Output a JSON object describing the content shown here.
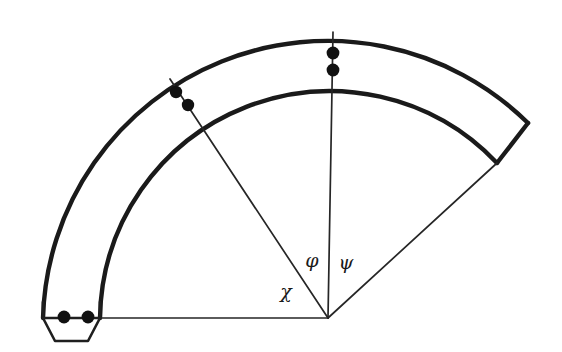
{
  "figure": {
    "background_color": "#ffffff",
    "stroke_color": "#1a1a1a",
    "dot_color": "#111111",
    "center": {
      "x": 328,
      "y": 318
    },
    "radii": {
      "outer": 285,
      "inner": 230
    },
    "angles_deg": {
      "start": 0,
      "end": 180
    },
    "labels": [
      {
        "id": "phi",
        "text": "φ",
        "x": 312,
        "y": 262
      },
      {
        "id": "psi",
        "text": "ψ",
        "x": 346,
        "y": 264
      },
      {
        "id": "chi",
        "text": "χ",
        "x": 286,
        "y": 293
      }
    ],
    "rays": [
      {
        "id": "ray-chi",
        "from": {
          "x": 328,
          "y": 318
        },
        "to": {
          "x": 170,
          "y": 79
        }
      },
      {
        "id": "ray-phi",
        "from": {
          "x": 328,
          "y": 318
        },
        "to": {
          "x": 333,
          "y": 32
        }
      },
      {
        "id": "ray-psi",
        "from": {
          "x": 328,
          "y": 318
        },
        "to": {
          "x": 497,
          "y": 163
        }
      },
      {
        "id": "ray-baseline",
        "from": {
          "x": 328,
          "y": 318
        },
        "to": {
          "x": 43,
          "y": 318
        }
      }
    ],
    "dots": [
      {
        "id": "dot-chi-outer",
        "x": 176,
        "y": 92,
        "r": 6.2
      },
      {
        "id": "dot-chi-inner",
        "x": 188,
        "y": 105,
        "r": 6.2
      },
      {
        "id": "dot-phi-outer",
        "x": 333,
        "y": 53,
        "r": 6.4
      },
      {
        "id": "dot-phi-inner",
        "x": 333,
        "y": 70,
        "r": 6.4
      },
      {
        "id": "dot-base-left",
        "x": 64,
        "y": 317,
        "r": 6.4
      },
      {
        "id": "dot-base-right",
        "x": 88,
        "y": 317,
        "r": 6.4
      }
    ],
    "end_caps": {
      "right_cap": {
        "from": {
          "x": 528,
          "y": 123
        },
        "to": {
          "x": 497,
          "y": 163
        }
      },
      "left_outer_edge": {
        "from": {
          "x": 43,
          "y": 318
        },
        "to": {
          "x": 43,
          "y": 300
        }
      },
      "left_inner_edge": {
        "from": {
          "x": 100,
          "y": 318
        },
        "to": {
          "x": 100,
          "y": 300
        }
      }
    },
    "trapezoid": {
      "id": "base-trapezoid",
      "points": "43,318 100,318 88,341 55,341"
    }
  }
}
